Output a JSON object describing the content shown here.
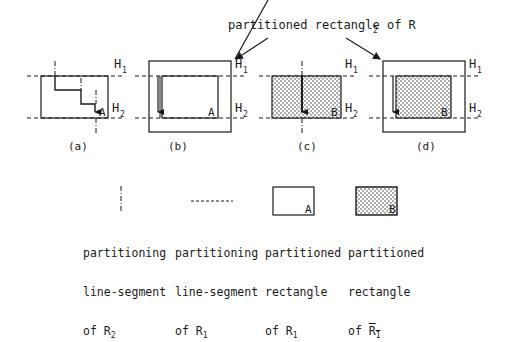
{
  "title_annotation": {
    "text": "partitioned rectangle of R",
    "subscript": "2"
  },
  "guide_labels": {
    "h1": "H",
    "h1_sub": "1",
    "h2": "H",
    "h2_sub": "2"
  },
  "panels": [
    {
      "id": "a",
      "caption": "(a)",
      "corner_label": "A",
      "fill": "none"
    },
    {
      "id": "b",
      "caption": "(b)",
      "corner_label": "A",
      "fill": "none"
    },
    {
      "id": "c",
      "caption": "(c)",
      "corner_label": "B",
      "fill": "dotted"
    },
    {
      "id": "d",
      "caption": "(d)",
      "corner_label": "B",
      "fill": "dotted"
    }
  ],
  "legend": [
    {
      "symbol": "dash-dot-vertical-line",
      "line1": "partitioning",
      "line2": "line-segment",
      "line3_prefix": "of R",
      "line3_sub": "2"
    },
    {
      "symbol": "dashed-horizontal-line",
      "line1": "partitioning",
      "line2": "line-segment",
      "line3_prefix": "of R",
      "line3_sub": "1"
    },
    {
      "symbol": "empty-rectangle",
      "corner_label": "A",
      "line1": "partitioned",
      "line2": "rectangle",
      "line3_prefix": "of R",
      "line3_sub": "1"
    },
    {
      "symbol": "dotted-rectangle",
      "corner_label": "B",
      "line1": "partitioned",
      "line2": "rectangle",
      "line3_prefix": "of R",
      "line3_sub": "1",
      "overline": true
    }
  ],
  "colors": {
    "ink": "#1a1a1a",
    "background": "#ffffff"
  }
}
